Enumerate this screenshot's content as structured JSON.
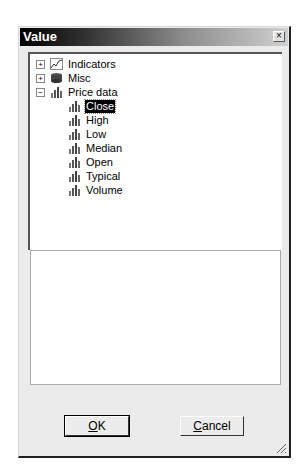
{
  "dialog": {
    "title": "Value",
    "close_label": "×"
  },
  "tree": {
    "nodes": [
      {
        "label": "Indicators",
        "icon": "indicator-line-icon",
        "expander": "+",
        "level": 0
      },
      {
        "label": "Misc",
        "icon": "misc-database-icon",
        "expander": "+",
        "level": 0
      },
      {
        "label": "Price data",
        "icon": "bar-chart-icon",
        "expander": "−",
        "level": 0
      },
      {
        "label": "Close",
        "icon": "bar-chart-icon",
        "level": 1,
        "selected": true
      },
      {
        "label": "High",
        "icon": "bar-chart-icon",
        "level": 1
      },
      {
        "label": "Low",
        "icon": "bar-chart-icon",
        "level": 1
      },
      {
        "label": "Median",
        "icon": "bar-chart-icon",
        "level": 1
      },
      {
        "label": "Open",
        "icon": "bar-chart-icon",
        "level": 1
      },
      {
        "label": "Typical",
        "icon": "bar-chart-icon",
        "level": 1
      },
      {
        "label": "Volume",
        "icon": "bar-chart-icon",
        "level": 1
      }
    ]
  },
  "buttons": {
    "ok_label": "OK",
    "ok_accel": "O",
    "cancel_label": "Cancel",
    "cancel_accel": "C"
  }
}
